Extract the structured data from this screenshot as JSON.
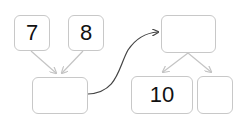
{
  "diagram": {
    "left_group": {
      "inputs": [
        {
          "value": "7"
        },
        {
          "value": "8"
        }
      ],
      "result": {
        "value": ""
      }
    },
    "right_group": {
      "source": {
        "value": ""
      },
      "outputs": [
        {
          "value": "10"
        },
        {
          "value": ""
        }
      ]
    },
    "colors": {
      "box_border": "#c8c8c8",
      "arrow_gray": "#c4c4c4",
      "curve_dark": "#444444",
      "text": "#111111"
    }
  }
}
